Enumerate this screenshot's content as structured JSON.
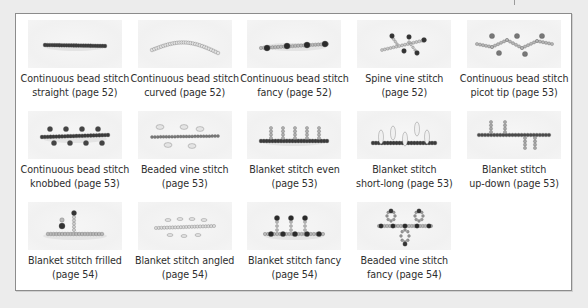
{
  "figure": {
    "items": [
      {
        "line1": "Continuous bead stitch",
        "line2": "straight (page 52)",
        "icon": "bead-stitch-straight-icon",
        "style": "straight",
        "bead_color": "#3a3a3a"
      },
      {
        "line1": "Continuous bead stitch",
        "line2": "curved (page 52)",
        "icon": "bead-stitch-curved-icon",
        "style": "curved",
        "bead_color": "#e2e2e2"
      },
      {
        "line1": "Continuous bead stitch",
        "line2": "fancy (page 52)",
        "icon": "bead-stitch-fancy-icon",
        "style": "fancy",
        "bead_color": "#8a8a8a"
      },
      {
        "line1": "Spine vine stitch",
        "line2": "(page 52)",
        "icon": "spine-vine-stitch-icon",
        "style": "spine",
        "bead_color": "#b0b0b0"
      },
      {
        "line1": "Continuous bead stitch",
        "line2": "picot tip (page 53)",
        "icon": "bead-stitch-picot-icon",
        "style": "picot",
        "bead_color": "#a0a0a0"
      },
      {
        "line1": "Continuous bead stitch",
        "line2": "knobbed (page 53)",
        "icon": "bead-stitch-knobbed-icon",
        "style": "knobbed",
        "bead_color": "#3a3a3a"
      },
      {
        "line1": "Beaded vine stitch",
        "line2": "(page 53)",
        "icon": "beaded-vine-stitch-icon",
        "style": "vine",
        "bead_color": "#dcdcdc"
      },
      {
        "line1": "Blanket stitch even",
        "line2": "(page 53)",
        "icon": "blanket-stitch-even-icon",
        "style": "even",
        "bead_color": "#3a3a3a"
      },
      {
        "line1": "Blanket stitch",
        "line2": "short-long (page 53)",
        "icon": "blanket-stitch-short-long-icon",
        "style": "shortlong",
        "bead_color": "#3a3a3a"
      },
      {
        "line1": "Blanket stitch",
        "line2": "up-down (page 53)",
        "icon": "blanket-stitch-up-down-icon",
        "style": "updown",
        "bead_color": "#4a4a4a"
      },
      {
        "line1": "Blanket stitch frilled",
        "line2": "(page 54)",
        "icon": "blanket-stitch-frilled-icon",
        "style": "frilled",
        "bead_color": "#8a8a8a"
      },
      {
        "line1": "Blanket stitch angled",
        "line2": "(page 54)",
        "icon": "blanket-stitch-angled-icon",
        "style": "angled",
        "bead_color": "#e0e0e0"
      },
      {
        "line1": "Blanket stitch fancy",
        "line2": "(page 54)",
        "icon": "blanket-stitch-fancy-icon",
        "style": "bfancy",
        "bead_color": "#9a9a9a"
      },
      {
        "line1": "Beaded vine stitch",
        "line2": "fancy (page 54)",
        "icon": "beaded-vine-stitch-fancy-icon",
        "style": "vfancy",
        "bead_color": "#8a8a8a"
      }
    ]
  }
}
